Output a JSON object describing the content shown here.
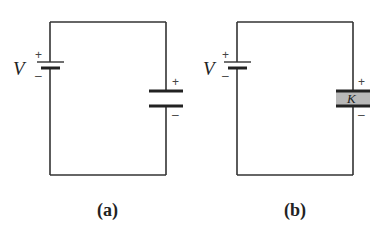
{
  "figure": {
    "panels": [
      {
        "id": "a",
        "caption": "(a)",
        "battery": {
          "label": "V",
          "plus": "+",
          "minus": "–"
        },
        "capacitor": {
          "plus": "+",
          "minus": "–",
          "dielectric": null
        }
      },
      {
        "id": "b",
        "caption": "(b)",
        "battery": {
          "label": "V",
          "plus": "+",
          "minus": "–"
        },
        "capacitor": {
          "plus": "+",
          "minus": "–",
          "dielectric": "K"
        }
      }
    ],
    "colors": {
      "wire": "#333333",
      "dielectric_fill": "#b8b8b8",
      "background": "#ffffff"
    }
  }
}
